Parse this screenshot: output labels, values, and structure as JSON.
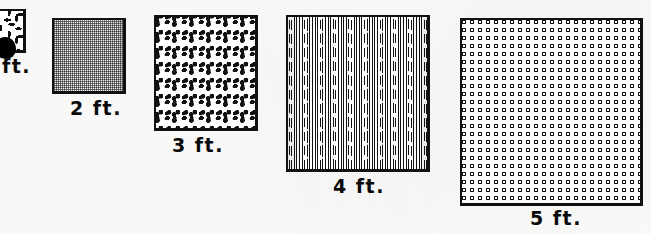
{
  "figure": {
    "background_color": "#fdfdfb",
    "ink_color": "#111111",
    "width_px": 651,
    "height_px": 234
  },
  "swatches": [
    {
      "id": "swatch-1ft",
      "label": "ft.",
      "full_label": "1 ft.",
      "size_ft": 1,
      "pattern": "scribble",
      "clipped_at_left_edge": true,
      "box": {
        "x": -22,
        "y": 9,
        "w": 48,
        "h": 44
      },
      "caption_pos": {
        "x": 2,
        "y": 57
      }
    },
    {
      "id": "swatch-2ft",
      "label": "2 ft.",
      "full_label": "2 ft.",
      "size_ft": 2,
      "pattern": "halftone-grey",
      "clipped_at_left_edge": false,
      "box": {
        "x": 52,
        "y": 18,
        "w": 74,
        "h": 76
      },
      "caption_pos": {
        "x": 70,
        "y": 99
      }
    },
    {
      "id": "swatch-3ft",
      "label": "3 ft.",
      "full_label": "3 ft.",
      "size_ft": 3,
      "pattern": "random-speckle",
      "clipped_at_left_edge": false,
      "box": {
        "x": 154,
        "y": 15,
        "w": 104,
        "h": 116
      },
      "caption_pos": {
        "x": 172,
        "y": 136
      }
    },
    {
      "id": "swatch-4ft",
      "label": "4 ft.",
      "full_label": "4 ft.",
      "size_ft": 4,
      "pattern": "vertical-lines-with-dots",
      "clipped_at_left_edge": false,
      "box": {
        "x": 286,
        "y": 15,
        "w": 144,
        "h": 157
      },
      "caption_pos": {
        "x": 333,
        "y": 177
      }
    },
    {
      "id": "swatch-5ft",
      "label": "5 ft.",
      "full_label": "5 ft.",
      "size_ft": 5,
      "pattern": "ring-grid",
      "clipped_at_left_edge": false,
      "box": {
        "x": 460,
        "y": 18,
        "w": 183,
        "h": 188
      },
      "caption_pos": {
        "x": 530,
        "y": 209
      }
    }
  ],
  "marks": {
    "ink_blot": {
      "x": -6,
      "y": 37,
      "w": 22,
      "h": 22,
      "color": "#000000"
    }
  }
}
